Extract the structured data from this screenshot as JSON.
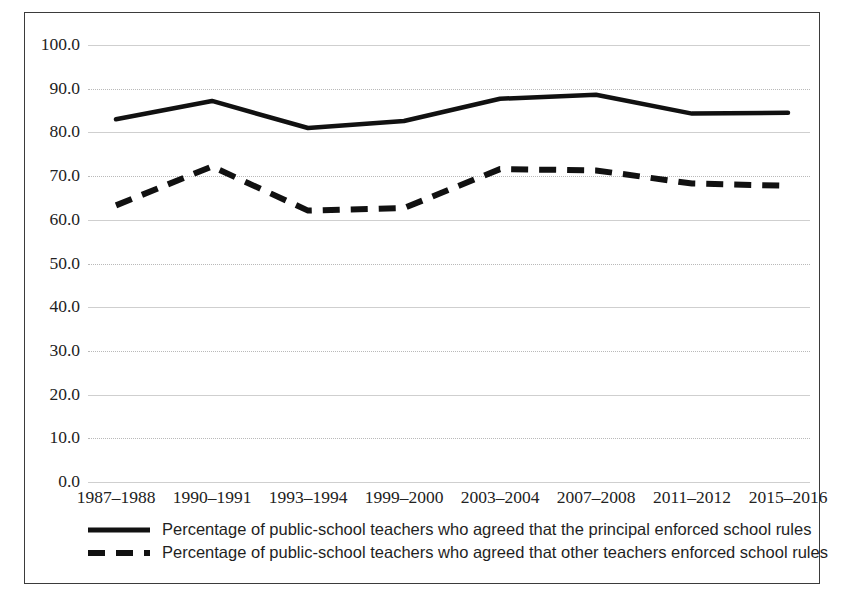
{
  "chart_data": {
    "type": "line",
    "title": "",
    "subtitle": "",
    "xlabel": "",
    "ylabel": "",
    "ylim": [
      0,
      100
    ],
    "grid": true,
    "legend_position": "bottom",
    "categories": [
      "1987–1988",
      "1990–1991",
      "1993–1994",
      "1999–2000",
      "2003–2004",
      "2007–2008",
      "2011–2012",
      "2015–2016"
    ],
    "ytick_labels": [
      "100.0",
      "90.0",
      "80.0",
      "70.0",
      "60.0",
      "50.0",
      "40.0",
      "30.0",
      "20.0",
      "10.0",
      "0.0"
    ],
    "ytick_values": [
      100,
      90,
      80,
      70,
      60,
      50,
      40,
      30,
      20,
      10,
      0
    ],
    "series": [
      {
        "name": "Percentage of public-school teachers who agreed that the principal enforced school rules",
        "style": "solid",
        "color": "#111111",
        "values": [
          83.0,
          87.2,
          81.0,
          82.6,
          87.7,
          88.6,
          84.3,
          84.5
        ]
      },
      {
        "name": "Percentage of public-school teachers who agreed that other teachers enforced school rules",
        "style": "dashed",
        "color": "#111111",
        "values": [
          63.3,
          72.2,
          62.1,
          62.7,
          71.6,
          71.3,
          68.3,
          67.8
        ]
      }
    ]
  },
  "legend": {
    "items": [
      {
        "label": "Percentage of public-school teachers who agreed that the principal enforced school rules",
        "style": "solid"
      },
      {
        "label": "Percentage of public-school teachers who agreed that other teachers enforced school rules",
        "style": "dashed"
      }
    ]
  }
}
